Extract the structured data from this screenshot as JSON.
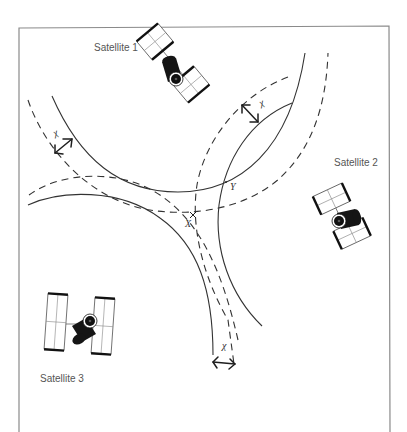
{
  "diagram": {
    "title": "",
    "labels": {
      "satellite_1": "Satellite 1",
      "satellite_2": "Satellite 2",
      "satellite_3": "Satellite 3",
      "intersection_x": "X",
      "intersection_y": "Y",
      "chi_1": "χ",
      "chi_2": "χ",
      "chi_3": "χ"
    },
    "colors": {
      "line": "#333333",
      "frame": "#8a8a8a",
      "label_text": "#555555",
      "satellite_body": "#151515"
    },
    "elements": {
      "satellites": [
        {
          "id": "satellite_1",
          "label": "Satellite 1",
          "position": [
            173,
            63
          ]
        },
        {
          "id": "satellite_2",
          "label": "Satellite 2",
          "position": [
            340,
            217
          ]
        },
        {
          "id": "satellite_3",
          "label": "Satellite 3",
          "position": [
            77,
            322
          ]
        }
      ],
      "range_rings": [
        {
          "satellite": "satellite_1",
          "style": "solid"
        },
        {
          "satellite": "satellite_1",
          "style": "dashed",
          "offset": "χ"
        },
        {
          "satellite": "satellite_2",
          "style": "solid"
        },
        {
          "satellite": "satellite_2",
          "style": "dashed",
          "offset": "χ"
        },
        {
          "satellite": "satellite_3",
          "style": "solid"
        },
        {
          "satellite": "satellite_3",
          "style": "dashed",
          "offset": "χ"
        }
      ],
      "points": [
        {
          "id": "X",
          "label": "X",
          "position": [
            193,
            215
          ],
          "note": "intersection of dashed rings"
        },
        {
          "id": "Y",
          "label": "Y",
          "position": [
            227,
            182
          ],
          "note": "intersection of solid rings"
        }
      ],
      "offset_markers": [
        {
          "label": "χ",
          "between": "satellite_1 rings",
          "position": [
            62,
            147
          ]
        },
        {
          "label": "χ",
          "between": "satellite_2 rings",
          "position": [
            251,
            112
          ]
        },
        {
          "label": "χ",
          "between": "satellite_3 rings",
          "position": [
            224,
            359
          ]
        }
      ]
    }
  }
}
